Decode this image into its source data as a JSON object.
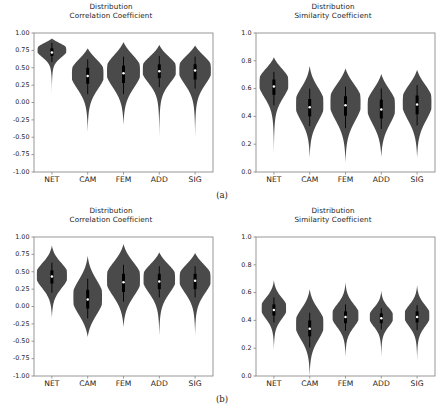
{
  "figure": {
    "background_color": "#ffffff",
    "violin_color": "#4a4a4a",
    "box_color": "#000000",
    "median_color": "#ffffff",
    "axis_color": "#8d8d8d",
    "text_color": "#1c1c1c"
  },
  "subfigures": [
    {
      "caption": "(a)"
    },
    {
      "caption": "(b)"
    }
  ],
  "chart_data": [
    {
      "type": "violin",
      "panel_id": "a-left",
      "title_line1": "Distribution",
      "title_line2": "Correlation Coefficient",
      "xlabel": "",
      "ylabel": "",
      "ylim": [
        -1.0,
        1.0
      ],
      "yticks": [
        -1.0,
        -0.75,
        -0.5,
        -0.25,
        0.0,
        0.25,
        0.5,
        0.75,
        1.0
      ],
      "ytick_labels": [
        "-1.00",
        "-0.75",
        "-0.50",
        "-0.25",
        "0.00",
        "0.25",
        "0.50",
        "0.75",
        "1.00"
      ],
      "categories": [
        "NET",
        "CAM",
        "FEM",
        "ADD",
        "SIG"
      ],
      "grid": false,
      "legend": "none",
      "series": [
        {
          "name": "NET",
          "median": 0.72,
          "q1": 0.67,
          "q3": 0.78,
          "whisker_low": 0.58,
          "whisker_high": 0.86,
          "min": 0.04,
          "max": 0.92,
          "width": 0.4,
          "peak": 0.76
        },
        {
          "name": "CAM",
          "median": 0.38,
          "q1": 0.27,
          "q3": 0.5,
          "whisker_low": 0.12,
          "whisker_high": 0.62,
          "min": -0.43,
          "max": 0.78,
          "width": 0.44,
          "peak": 0.42
        },
        {
          "name": "FEM",
          "median": 0.42,
          "q1": 0.28,
          "q3": 0.53,
          "whisker_low": 0.12,
          "whisker_high": 0.66,
          "min": -0.33,
          "max": 0.87,
          "width": 0.46,
          "peak": 0.46
        },
        {
          "name": "ADD",
          "median": 0.45,
          "q1": 0.35,
          "q3": 0.55,
          "whisker_low": 0.22,
          "whisker_high": 0.67,
          "min": -0.53,
          "max": 0.83,
          "width": 0.46,
          "peak": 0.48
        },
        {
          "name": "SIG",
          "median": 0.46,
          "q1": 0.33,
          "q3": 0.55,
          "whisker_low": 0.2,
          "whisker_high": 0.66,
          "min": -0.52,
          "max": 0.82,
          "width": 0.44,
          "peak": 0.48
        }
      ]
    },
    {
      "type": "violin",
      "panel_id": "a-right",
      "title_line1": "Distribution",
      "title_line2": "Similarity Coefficient",
      "xlabel": "",
      "ylabel": "",
      "ylim": [
        0.0,
        1.0
      ],
      "yticks": [
        0.0,
        0.2,
        0.4,
        0.6,
        0.8,
        1.0
      ],
      "ytick_labels": [
        "0.0",
        "0.2",
        "0.4",
        "0.6",
        "0.8",
        "1.0"
      ],
      "categories": [
        "NET",
        "CAM",
        "FEM",
        "ADD",
        "SIG"
      ],
      "grid": false,
      "legend": "none",
      "series": [
        {
          "name": "NET",
          "median": 0.615,
          "q1": 0.555,
          "q3": 0.665,
          "whisker_low": 0.48,
          "whisker_high": 0.72,
          "min": 0.115,
          "max": 0.825,
          "width": 0.4,
          "peak": 0.645
        },
        {
          "name": "CAM",
          "median": 0.465,
          "q1": 0.4,
          "q3": 0.525,
          "whisker_low": 0.33,
          "whisker_high": 0.6,
          "min": 0.1,
          "max": 0.765,
          "width": 0.38,
          "peak": 0.49
        },
        {
          "name": "FEM",
          "median": 0.48,
          "q1": 0.405,
          "q3": 0.545,
          "whisker_low": 0.315,
          "whisker_high": 0.615,
          "min": 0.065,
          "max": 0.745,
          "width": 0.42,
          "peak": 0.505
        },
        {
          "name": "ADD",
          "median": 0.45,
          "q1": 0.385,
          "q3": 0.52,
          "whisker_low": 0.31,
          "whisker_high": 0.6,
          "min": 0.105,
          "max": 0.705,
          "width": 0.38,
          "peak": 0.475
        },
        {
          "name": "SIG",
          "median": 0.485,
          "q1": 0.415,
          "q3": 0.55,
          "whisker_low": 0.335,
          "whisker_high": 0.625,
          "min": 0.1,
          "max": 0.735,
          "width": 0.4,
          "peak": 0.505
        }
      ]
    },
    {
      "type": "violin",
      "panel_id": "b-left",
      "title_line1": "Distribution",
      "title_line2": "Correlation Coefficient",
      "xlabel": "",
      "ylabel": "",
      "ylim": [
        -1.0,
        1.0
      ],
      "yticks": [
        -1.0,
        -0.75,
        -0.5,
        -0.25,
        0.0,
        0.25,
        0.5,
        0.75,
        1.0
      ],
      "ytick_labels": [
        "-1.00",
        "-0.75",
        "-0.50",
        "-0.25",
        "0.00",
        "0.25",
        "0.50",
        "0.75",
        "1.00"
      ],
      "categories": [
        "NET",
        "CAM",
        "FEM",
        "ADD",
        "SIG"
      ],
      "grid": false,
      "legend": "none",
      "series": [
        {
          "name": "NET",
          "median": 0.43,
          "q1": 0.33,
          "q3": 0.52,
          "whisker_low": 0.2,
          "whisker_high": 0.63,
          "min": -0.17,
          "max": 0.88,
          "width": 0.42,
          "peak": 0.45
        },
        {
          "name": "CAM",
          "median": 0.1,
          "q1": -0.03,
          "q3": 0.24,
          "whisker_low": -0.17,
          "whisker_high": 0.4,
          "min": -0.44,
          "max": 0.73,
          "width": 0.4,
          "peak": 0.13
        },
        {
          "name": "FEM",
          "median": 0.35,
          "q1": 0.21,
          "q3": 0.47,
          "whisker_low": 0.07,
          "whisker_high": 0.6,
          "min": -0.3,
          "max": 0.9,
          "width": 0.46,
          "peak": 0.4
        },
        {
          "name": "ADD",
          "median": 0.36,
          "q1": 0.25,
          "q3": 0.47,
          "whisker_low": 0.13,
          "whisker_high": 0.58,
          "min": -0.43,
          "max": 0.78,
          "width": 0.44,
          "peak": 0.41
        },
        {
          "name": "SIG",
          "median": 0.37,
          "q1": 0.25,
          "q3": 0.47,
          "whisker_low": 0.13,
          "whisker_high": 0.58,
          "min": -0.42,
          "max": 0.77,
          "width": 0.43,
          "peak": 0.41
        }
      ]
    },
    {
      "type": "violin",
      "panel_id": "b-right",
      "title_line1": "Distribution",
      "title_line2": "Similarity Coefficient",
      "xlabel": "",
      "ylabel": "",
      "ylim": [
        0.0,
        1.0
      ],
      "yticks": [
        0.0,
        0.2,
        0.4,
        0.6,
        0.8,
        1.0
      ],
      "ytick_labels": [
        "0.0",
        "0.2",
        "0.4",
        "0.6",
        "0.8",
        "1.0"
      ],
      "categories": [
        "NET",
        "CAM",
        "FEM",
        "ADD",
        "SIG"
      ],
      "grid": false,
      "legend": "none",
      "series": [
        {
          "name": "NET",
          "median": 0.475,
          "q1": 0.435,
          "q3": 0.515,
          "whisker_low": 0.385,
          "whisker_high": 0.565,
          "min": 0.185,
          "max": 0.69,
          "width": 0.34,
          "peak": 0.49
        },
        {
          "name": "CAM",
          "median": 0.34,
          "q1": 0.285,
          "q3": 0.4,
          "whisker_low": 0.205,
          "whisker_high": 0.455,
          "min": 0.0,
          "max": 0.625,
          "width": 0.38,
          "peak": 0.375
        },
        {
          "name": "FEM",
          "median": 0.425,
          "q1": 0.38,
          "q3": 0.465,
          "whisker_low": 0.325,
          "whisker_high": 0.515,
          "min": 0.135,
          "max": 0.675,
          "width": 0.36,
          "peak": 0.435
        },
        {
          "name": "ADD",
          "median": 0.415,
          "q1": 0.38,
          "q3": 0.45,
          "whisker_low": 0.335,
          "whisker_high": 0.49,
          "min": 0.13,
          "max": 0.615,
          "width": 0.32,
          "peak": 0.425
        },
        {
          "name": "SIG",
          "median": 0.425,
          "q1": 0.385,
          "q3": 0.465,
          "whisker_low": 0.33,
          "whisker_high": 0.51,
          "min": 0.105,
          "max": 0.655,
          "width": 0.34,
          "peak": 0.435
        }
      ]
    }
  ]
}
